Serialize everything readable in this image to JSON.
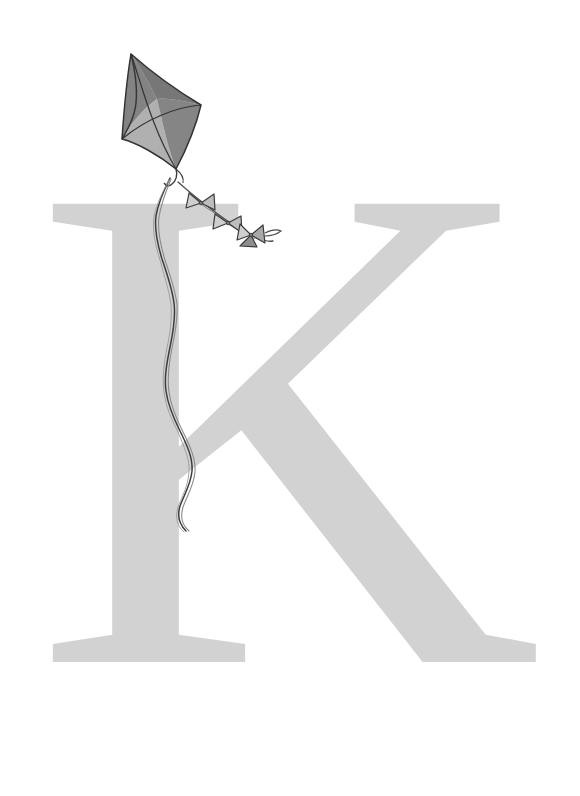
{
  "page": {
    "type": "alphabet-letter-illustration",
    "width": 580,
    "height": 796,
    "background_color": "#ffffff",
    "caption": ""
  },
  "letter": {
    "character": "K",
    "case": "uppercase",
    "style": "serif",
    "color": "#d2d2d2",
    "bounds": {
      "x": 44,
      "y": 263,
      "width": 501,
      "height": 487
    }
  },
  "illustration": {
    "subject_name": "kite",
    "description": "hand-drawn kite with bow-tie tail and twisted string",
    "line_color": "#3a3a3a",
    "body": {
      "panel_upper_left_color": "#8a8a8a",
      "panel_upper_right_color": "#7e7e7e",
      "panel_lower_left_color": "#c2c2c2",
      "panel_lower_right_color": "#8f8f8f",
      "vertices": {
        "top": [
          131,
          54
        ],
        "right": [
          201,
          105
        ],
        "bottom": [
          176,
          169
        ],
        "left": [
          122,
          139
        ]
      }
    },
    "tail": {
      "bow_count": 3,
      "bow_color": "#c9c9c9",
      "bow_positions": [
        [
          201,
          203
        ],
        [
          228,
          223
        ],
        [
          251,
          235
        ]
      ]
    },
    "string": {
      "description": "twisted string descending from kite",
      "start": [
        150,
        178
      ],
      "end": [
        191,
        531
      ]
    }
  }
}
